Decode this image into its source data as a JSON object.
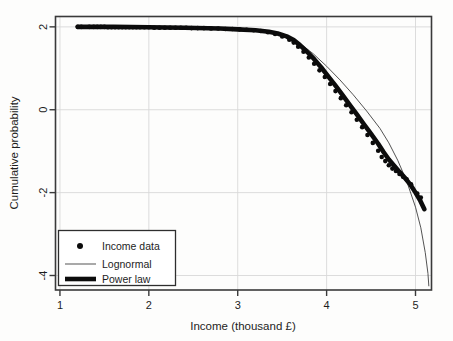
{
  "chart_data": {
    "type": "line",
    "title": "",
    "xlabel": "Income (thousand £)",
    "ylabel": "Cumulative probability",
    "xlim": [
      0.95,
      5.18
    ],
    "ylim": [
      -4.35,
      2.25
    ],
    "xticks": [
      1,
      2,
      3,
      4,
      5
    ],
    "xtick_labels": [
      "1",
      "2",
      "3",
      "4",
      "5"
    ],
    "yticks": [
      2,
      0,
      -2,
      -4
    ],
    "ytick_labels": [
      "2",
      "0",
      "-2",
      "-4"
    ],
    "grid": true,
    "legend_position": "lower left",
    "legend_entries": [
      {
        "label": "Income data",
        "marker": "dot"
      },
      {
        "label": "Lognormal",
        "marker": "thin-line"
      },
      {
        "label": "Power law",
        "marker": "thick-line"
      }
    ],
    "series": [
      {
        "name": "Income data",
        "marker": "dot",
        "points": [
          [
            1.2,
            2.0
          ],
          [
            1.24,
            2.0
          ],
          [
            1.33,
            2.0
          ],
          [
            1.38,
            2.0
          ],
          [
            1.42,
            2.0
          ],
          [
            1.46,
            2.0
          ],
          [
            1.5,
            2.0
          ],
          [
            1.54,
            1.99
          ],
          [
            1.58,
            1.99
          ],
          [
            1.62,
            1.99
          ],
          [
            1.66,
            1.99
          ],
          [
            1.7,
            1.99
          ],
          [
            1.74,
            1.99
          ],
          [
            1.78,
            1.99
          ],
          [
            1.82,
            1.99
          ],
          [
            1.86,
            1.99
          ],
          [
            1.9,
            1.99
          ],
          [
            1.95,
            1.99
          ],
          [
            2.0,
            1.99
          ],
          [
            2.06,
            1.98
          ],
          [
            2.12,
            1.98
          ],
          [
            2.18,
            1.98
          ],
          [
            2.24,
            1.98
          ],
          [
            2.3,
            1.98
          ],
          [
            2.36,
            1.98
          ],
          [
            2.42,
            1.98
          ],
          [
            2.48,
            1.97
          ],
          [
            2.55,
            1.97
          ],
          [
            2.62,
            1.97
          ],
          [
            2.7,
            1.96
          ],
          [
            2.78,
            1.96
          ],
          [
            2.86,
            1.95
          ],
          [
            2.94,
            1.95
          ],
          [
            3.02,
            1.94
          ],
          [
            3.1,
            1.93
          ],
          [
            3.18,
            1.92
          ],
          [
            3.26,
            1.9
          ],
          [
            3.34,
            1.87
          ],
          [
            3.42,
            1.83
          ],
          [
            3.5,
            1.77
          ],
          [
            3.58,
            1.69
          ],
          [
            3.63,
            1.62
          ],
          [
            3.68,
            1.52
          ],
          [
            3.74,
            1.4
          ],
          [
            3.8,
            1.26
          ],
          [
            3.86,
            1.11
          ],
          [
            3.92,
            0.95
          ],
          [
            3.98,
            0.79
          ],
          [
            4.04,
            0.62
          ],
          [
            4.1,
            0.45
          ],
          [
            4.16,
            0.28
          ],
          [
            4.22,
            0.11
          ],
          [
            4.28,
            -0.06
          ],
          [
            4.34,
            -0.24
          ],
          [
            4.4,
            -0.42
          ],
          [
            4.46,
            -0.61
          ],
          [
            4.52,
            -0.8
          ],
          [
            4.58,
            -0.99
          ],
          [
            4.62,
            -1.14
          ],
          [
            4.66,
            -1.24
          ],
          [
            4.7,
            -1.34
          ],
          [
            4.74,
            -1.42
          ],
          [
            4.78,
            -1.48
          ],
          [
            4.82,
            -1.55
          ],
          [
            4.86,
            -1.62
          ],
          [
            4.9,
            -1.68
          ],
          [
            4.95,
            -1.8
          ],
          [
            5.02,
            -2.02
          ],
          [
            5.06,
            -2.12
          ]
        ]
      },
      {
        "name": "Lognormal",
        "marker": "thin-line",
        "points": [
          [
            1.2,
            2.0
          ],
          [
            1.6,
            2.0
          ],
          [
            2.0,
            1.99
          ],
          [
            2.4,
            1.98
          ],
          [
            2.8,
            1.96
          ],
          [
            3.0,
            1.94
          ],
          [
            3.2,
            1.92
          ],
          [
            3.4,
            1.86
          ],
          [
            3.55,
            1.77
          ],
          [
            3.7,
            1.6
          ],
          [
            3.85,
            1.35
          ],
          [
            4.0,
            1.05
          ],
          [
            4.15,
            0.72
          ],
          [
            4.3,
            0.36
          ],
          [
            4.45,
            -0.03
          ],
          [
            4.6,
            -0.45
          ],
          [
            4.7,
            -0.8
          ],
          [
            4.8,
            -1.22
          ],
          [
            4.9,
            -1.72
          ],
          [
            5.0,
            -2.35
          ],
          [
            5.06,
            -2.85
          ],
          [
            5.11,
            -3.45
          ],
          [
            5.14,
            -3.95
          ],
          [
            5.15,
            -4.25
          ]
        ]
      },
      {
        "name": "Power law",
        "marker": "thick-line",
        "points": [
          [
            1.2,
            2.0
          ],
          [
            1.6,
            2.0
          ],
          [
            2.0,
            1.99
          ],
          [
            2.4,
            1.98
          ],
          [
            2.8,
            1.96
          ],
          [
            3.0,
            1.94
          ],
          [
            3.2,
            1.92
          ],
          [
            3.35,
            1.88
          ],
          [
            3.45,
            1.84
          ],
          [
            3.55,
            1.77
          ],
          [
            3.63,
            1.68
          ],
          [
            3.7,
            1.56
          ],
          [
            3.78,
            1.4
          ],
          [
            3.86,
            1.22
          ],
          [
            3.94,
            1.02
          ],
          [
            4.02,
            0.8
          ],
          [
            4.1,
            0.58
          ],
          [
            4.18,
            0.35
          ],
          [
            4.26,
            0.12
          ],
          [
            4.34,
            -0.11
          ],
          [
            4.42,
            -0.35
          ],
          [
            4.5,
            -0.58
          ],
          [
            4.58,
            -0.82
          ],
          [
            4.64,
            -1.02
          ],
          [
            4.7,
            -1.2
          ],
          [
            4.76,
            -1.35
          ],
          [
            4.82,
            -1.5
          ],
          [
            4.88,
            -1.64
          ],
          [
            4.94,
            -1.8
          ],
          [
            5.0,
            -2.0
          ],
          [
            5.05,
            -2.18
          ],
          [
            5.1,
            -2.4
          ]
        ]
      }
    ]
  }
}
